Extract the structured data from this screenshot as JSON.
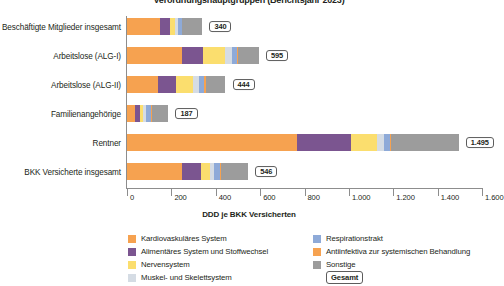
{
  "title": "Verordnungshauptgruppen (Berichtsjahr 2023)",
  "xlabel": "DDD je BKK Versicherten",
  "colors": {
    "kardiovaskular": "#F6A250",
    "alimentar": "#7B5590",
    "nerven": "#FBDE6E",
    "muskel": "#D5DCE4",
    "respiration": "#8EAAD8",
    "antiinfektiva": "#F6A250",
    "sonstige": "#9C9C9C",
    "axis": "#8d8d8d"
  },
  "legend": {
    "left": [
      {
        "label": "Kardiovaskuläres System",
        "color": "#F6A250",
        "key": "kardiovaskular"
      },
      {
        "label": "Alimentäres System und Stoffwechsel",
        "color": "#7B5590",
        "key": "alimentar"
      },
      {
        "label": "Nervensystem",
        "color": "#FBDE6E",
        "key": "nerven"
      },
      {
        "label": "Muskel- und Skelettsystem",
        "color": "#D5DCE4",
        "key": "muskel"
      }
    ],
    "right": [
      {
        "label": "Respirationstrakt",
        "color": "#8EAAD8",
        "key": "respiration"
      },
      {
        "label": "Antiinfektiva zur systemischen Behandlung",
        "color": "#F6A250",
        "key": "antiinfektiva"
      },
      {
        "label": "Sonstige",
        "color": "#9C9C9C",
        "key": "sonstige"
      }
    ],
    "total_label": "Gesamt"
  },
  "chart_data": {
    "type": "bar",
    "orientation": "horizontal",
    "stacked": true,
    "title": "Verordnungshauptgruppen (Berichtsjahr 2023)",
    "xlabel": "DDD je BKK Versicherten",
    "ylabel": "",
    "xlim": [
      0,
      1600
    ],
    "xticks": [
      0,
      200,
      400,
      600,
      800,
      1000,
      1200,
      1400,
      1600
    ],
    "xticklabels": [
      "0",
      "200",
      "400",
      "600",
      "800",
      "1.000",
      "1.200",
      "1.400",
      "1.600"
    ],
    "grid": false,
    "legend_position": "bottom",
    "categories": [
      "Beschäftigte Mitglieder insgesamt",
      "Arbeitslose (ALG-I)",
      "Arbeitslose (ALG-II)",
      "Familienangehörige",
      "Rentner",
      "BKK Versicherte insgesamt"
    ],
    "totals": [
      340,
      595,
      444,
      187,
      1495,
      546
    ],
    "total_labels": [
      "340",
      "595",
      "444",
      "187",
      "1.495",
      "546"
    ],
    "series": [
      {
        "name": "Kardiovaskuläres System",
        "color": "#F6A250",
        "values": [
          150,
          248,
          140,
          36,
          766,
          248
        ]
      },
      {
        "name": "Alimentäres System und Stoffwechsel",
        "color": "#7B5590",
        "values": [
          42,
          95,
          82,
          22,
          243,
          86
        ]
      },
      {
        "name": "Nervensystem",
        "color": "#FBDE6E",
        "values": [
          26,
          99,
          76,
          14,
          117,
          41
        ]
      },
      {
        "name": "Muskel- und Skelettsystem",
        "color": "#D5DCE4",
        "values": [
          14,
          31,
          28,
          14,
          32,
          18
        ]
      },
      {
        "name": "Respirationstrakt",
        "color": "#8EAAD8",
        "values": [
          14,
          23,
          23,
          23,
          27,
          27
        ]
      },
      {
        "name": "Antiinfektiva zur systemischen Behandlung",
        "color": "#F6A250",
        "values": [
          4,
          5,
          5,
          5,
          5,
          5
        ]
      },
      {
        "name": "Sonstige",
        "color": "#9C9C9C",
        "values": [
          90,
          94,
          90,
          73,
          305,
          121
        ]
      }
    ]
  }
}
